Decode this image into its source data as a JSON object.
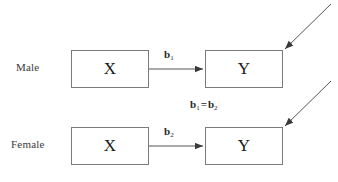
{
  "diagram": {
    "background_color": "#ffffff",
    "line_color": "#555555",
    "box_border_color": "#7a7a7a",
    "text_color": "#2a2a2a",
    "groups": [
      {
        "label": "Male",
        "predictor": "X",
        "outcome": "Y",
        "path_coefficient": "b",
        "path_subscript": "1"
      },
      {
        "label": "Female",
        "predictor": "X",
        "outcome": "Y",
        "path_coefficient": "b",
        "path_subscript": "2"
      }
    ],
    "constraint": {
      "left_symbol": "b",
      "left_subscript": "1",
      "operator": "=",
      "right_symbol": "b",
      "right_subscript": "2"
    },
    "icons": {
      "path_arrow": "arrow-right-icon",
      "disturbance_arrow": "diagonal-arrow-icon"
    }
  }
}
